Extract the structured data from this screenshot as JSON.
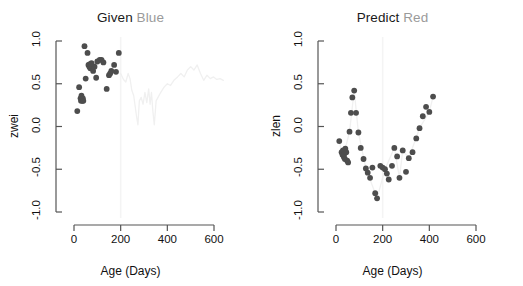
{
  "figure": {
    "background": "#ffffff",
    "point_color": "#4d4d4d",
    "line_color_faint": "#f0f0f0",
    "guide_color": "#f4f4f4",
    "axis_color": "#555555",
    "text_color": "#111111",
    "muted_text_color": "#9a9a9a"
  },
  "chart_data": [
    {
      "type": "scatter",
      "panel": "left",
      "title": "Given Blue",
      "title_main": "Given",
      "title_emph": "Blue",
      "xlabel": "Age (Days)",
      "ylabel": "zwei",
      "xlim": [
        -30,
        660
      ],
      "ylim": [
        -1.0,
        1.0
      ],
      "xticks": [
        0,
        200,
        400,
        600
      ],
      "xtick_labels": [
        "0",
        "200",
        "400",
        "600"
      ],
      "yticks": [
        -1.0,
        -0.5,
        0.0,
        0.5,
        1.0
      ],
      "ytick_labels": [
        "-1.0",
        "-0.5",
        "0.0",
        "0.5",
        "1.0"
      ],
      "grid": false,
      "legend": "none",
      "vline_x": 200,
      "points": [
        [
          14,
          0.18
        ],
        [
          22,
          0.46
        ],
        [
          28,
          0.33
        ],
        [
          30,
          0.3
        ],
        [
          32,
          0.36
        ],
        [
          36,
          0.3
        ],
        [
          38,
          0.33
        ],
        [
          40,
          0.3
        ],
        [
          45,
          0.94
        ],
        [
          50,
          0.56
        ],
        [
          58,
          0.86
        ],
        [
          62,
          0.72
        ],
        [
          66,
          0.7
        ],
        [
          68,
          0.73
        ],
        [
          70,
          0.68
        ],
        [
          72,
          0.71
        ],
        [
          75,
          0.74
        ],
        [
          82,
          0.65
        ],
        [
          88,
          0.7
        ],
        [
          95,
          0.57
        ],
        [
          100,
          0.76
        ],
        [
          110,
          0.78
        ],
        [
          118,
          0.78
        ],
        [
          126,
          0.75
        ],
        [
          140,
          0.44
        ],
        [
          150,
          0.6
        ],
        [
          155,
          0.62
        ],
        [
          160,
          0.65
        ],
        [
          172,
          0.72
        ],
        [
          180,
          0.64
        ],
        [
          192,
          0.86
        ]
      ],
      "faint_line": [
        [
          200,
          0.62
        ],
        [
          212,
          0.55
        ],
        [
          222,
          0.52
        ],
        [
          232,
          0.62
        ],
        [
          240,
          0.56
        ],
        [
          248,
          0.42
        ],
        [
          256,
          0.36
        ],
        [
          262,
          0.24
        ],
        [
          268,
          0.12
        ],
        [
          274,
          0.02
        ],
        [
          280,
          0.3
        ],
        [
          288,
          0.34
        ],
        [
          296,
          0.26
        ],
        [
          304,
          0.4
        ],
        [
          312,
          0.28
        ],
        [
          320,
          0.44
        ],
        [
          326,
          0.26
        ],
        [
          332,
          0.4
        ],
        [
          338,
          0.18
        ],
        [
          344,
          0.02
        ],
        [
          352,
          0.3
        ],
        [
          360,
          0.34
        ],
        [
          372,
          0.4
        ],
        [
          386,
          0.46
        ],
        [
          400,
          0.5
        ],
        [
          414,
          0.48
        ],
        [
          428,
          0.54
        ],
        [
          444,
          0.58
        ],
        [
          458,
          0.62
        ],
        [
          472,
          0.58
        ],
        [
          486,
          0.66
        ],
        [
          500,
          0.7
        ],
        [
          514,
          0.66
        ],
        [
          528,
          0.72
        ],
        [
          542,
          0.62
        ],
        [
          556,
          0.54
        ],
        [
          570,
          0.6
        ],
        [
          584,
          0.56
        ],
        [
          598,
          0.58
        ],
        [
          612,
          0.55
        ],
        [
          626,
          0.56
        ],
        [
          640,
          0.54
        ]
      ]
    },
    {
      "type": "scatter",
      "panel": "right",
      "title": "Predict Red",
      "title_main": "Predict",
      "title_emph": "Red",
      "xlabel": "Age (Days)",
      "ylabel": "zlen",
      "xlim": [
        -30,
        660
      ],
      "ylim": [
        -1.0,
        1.0
      ],
      "xticks": [
        0,
        200,
        400,
        600
      ],
      "xtick_labels": [
        "0",
        "200",
        "400",
        "600"
      ],
      "yticks": [
        -1.0,
        -0.5,
        0.0,
        0.5,
        1.0
      ],
      "ytick_labels": [
        "-1.0",
        "-0.5",
        "0.0",
        "0.5",
        "1.0"
      ],
      "grid": false,
      "legend": "none",
      "vline_x": 200,
      "points": [
        [
          14,
          -0.17
        ],
        [
          24,
          -0.3
        ],
        [
          28,
          -0.33
        ],
        [
          30,
          -0.28
        ],
        [
          34,
          -0.36
        ],
        [
          36,
          -0.32
        ],
        [
          38,
          -0.38
        ],
        [
          40,
          -0.26
        ],
        [
          44,
          -0.3
        ],
        [
          48,
          -0.4
        ],
        [
          52,
          -0.42
        ],
        [
          58,
          -0.06
        ],
        [
          64,
          0.16
        ],
        [
          70,
          0.34
        ],
        [
          78,
          0.42
        ],
        [
          86,
          0.16
        ],
        [
          96,
          -0.07
        ],
        [
          106,
          -0.25
        ],
        [
          118,
          -0.38
        ],
        [
          128,
          -0.49
        ],
        [
          136,
          -0.54
        ],
        [
          146,
          -0.6
        ],
        [
          156,
          -0.48
        ],
        [
          168,
          -0.78
        ],
        [
          176,
          -0.84
        ],
        [
          190,
          -0.46
        ],
        [
          200,
          -0.48
        ],
        [
          210,
          -0.5
        ],
        [
          218,
          -0.55
        ],
        [
          226,
          -0.62
        ],
        [
          240,
          -0.46
        ],
        [
          250,
          -0.25
        ],
        [
          262,
          -0.35
        ],
        [
          272,
          -0.6
        ],
        [
          286,
          -0.28
        ],
        [
          300,
          -0.53
        ],
        [
          312,
          -0.37
        ],
        [
          328,
          -0.3
        ],
        [
          344,
          -0.14
        ],
        [
          358,
          -0.02
        ],
        [
          372,
          0.12
        ],
        [
          386,
          0.23
        ],
        [
          400,
          0.17
        ],
        [
          416,
          0.35
        ]
      ],
      "faint_line": [
        [
          14,
          -0.17
        ],
        [
          24,
          -0.3
        ],
        [
          40,
          -0.26
        ],
        [
          58,
          -0.06
        ],
        [
          78,
          0.42
        ],
        [
          96,
          -0.07
        ],
        [
          128,
          -0.49
        ],
        [
          176,
          -0.84
        ],
        [
          210,
          -0.5
        ],
        [
          250,
          -0.25
        ],
        [
          272,
          -0.6
        ],
        [
          286,
          -0.28
        ],
        [
          312,
          -0.37
        ],
        [
          358,
          -0.02
        ],
        [
          400,
          0.17
        ],
        [
          416,
          0.35
        ]
      ]
    }
  ]
}
